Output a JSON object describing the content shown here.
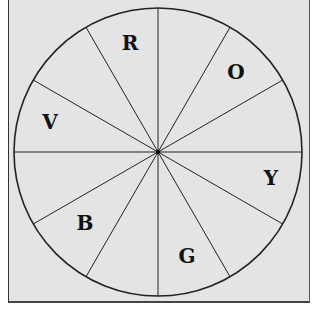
{
  "diagram": {
    "type": "color-wheel",
    "center": [
      158,
      152
    ],
    "radius": 144,
    "colors": {
      "background": "#e4e4e4",
      "stroke": "#222222"
    },
    "radii_angles_deg": [
      0,
      30,
      60,
      90,
      120,
      150,
      180,
      210,
      240,
      270,
      300,
      330
    ],
    "labels": [
      {
        "text": "R",
        "x": 130,
        "y": 50
      },
      {
        "text": "O",
        "x": 236,
        "y": 79
      },
      {
        "text": "Y",
        "x": 271,
        "y": 185
      },
      {
        "text": "G",
        "x": 187,
        "y": 263
      },
      {
        "text": "B",
        "x": 85,
        "y": 230
      },
      {
        "text": "V",
        "x": 50,
        "y": 129
      }
    ]
  }
}
